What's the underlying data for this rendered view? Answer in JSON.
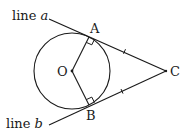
{
  "diagram": {
    "labels": {
      "line_a_prefix": "line ",
      "line_a_var": "a",
      "line_b_prefix": "line ",
      "line_b_var": "b",
      "point_a": "A",
      "point_b": "B",
      "point_c": "C",
      "point_o": "O"
    },
    "colors": {
      "stroke": "#1a1a1a",
      "background": "#ffffff"
    },
    "geometry": {
      "circle_center": [
        72,
        71
      ],
      "circle_radius": 38,
      "A": [
        89,
        37
      ],
      "B": [
        89,
        105
      ],
      "C": [
        166,
        71
      ]
    },
    "annotations": [
      "right-angle at A",
      "right-angle at B",
      "tick mark on AC",
      "tick mark on BC"
    ]
  }
}
